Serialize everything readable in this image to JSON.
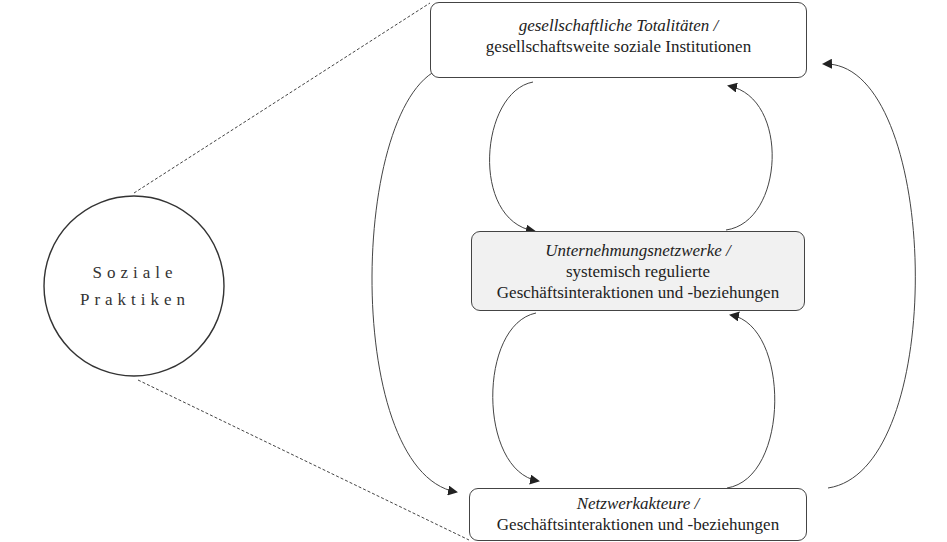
{
  "diagram": {
    "circle": {
      "line1": "Soziale",
      "line2": "Praktiken"
    },
    "boxes": {
      "top": {
        "title": "gesellschaftliche Totalitäten /",
        "subtitle": "gesellschaftsweite soziale Institutionen"
      },
      "middle": {
        "title": "Unternehmungsnetzwerke /",
        "subtitle_line1": "systemisch regulierte",
        "subtitle_line2": "Geschäftsinteraktionen und -beziehungen"
      },
      "bottom": {
        "title": "Netzwerkakteure /",
        "subtitle": "Geschäftsinteraktionen und -beziehungen"
      }
    },
    "connections": [
      {
        "from": "top",
        "to": "middle",
        "style": "arrow"
      },
      {
        "from": "middle",
        "to": "top",
        "style": "arrow"
      },
      {
        "from": "middle",
        "to": "bottom",
        "style": "arrow"
      },
      {
        "from": "bottom",
        "to": "middle",
        "style": "arrow"
      },
      {
        "from": "top",
        "to": "bottom",
        "style": "arrow"
      },
      {
        "from": "bottom",
        "to": "top",
        "style": "arrow"
      },
      {
        "from": "circle",
        "to": "top",
        "style": "dashed"
      },
      {
        "from": "circle",
        "to": "bottom",
        "style": "dashed"
      }
    ],
    "colors": {
      "stroke": "#444444",
      "middle_box_fill": "#f1f1f1"
    }
  }
}
